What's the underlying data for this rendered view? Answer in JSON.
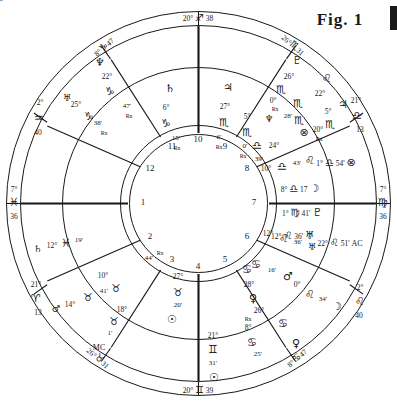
{
  "figure": {
    "caption": "Fig. 1",
    "type": "astrological-natal-chart-wheel"
  },
  "angles": {
    "mc": {
      "label_deg": "20°",
      "sign_glyph": "♐",
      "label_min": "38",
      "name": "MC",
      "text": "20° ♐ 38"
    },
    "ic": {
      "label_deg": "20°",
      "sign_glyph": "♊",
      "label_min": "39",
      "name": "IC",
      "text": "20° ♊ 39"
    },
    "dsc": {
      "label_deg": "7°",
      "sign_glyph": "♓",
      "label_min": "36",
      "name": "DSC",
      "text": "7° ♓ 36"
    },
    "asc": {
      "label_deg": "7°",
      "sign_glyph": "♍",
      "label_min": "36",
      "name": "ASC",
      "text": "7° ♍ 36"
    }
  },
  "outer_cusps": [
    {
      "id": "cusp-11",
      "deg": "8°",
      "glyph": "♑",
      "min": "47"
    },
    {
      "id": "cusp-12",
      "deg": "2°",
      "glyph": "♒",
      "min": "40"
    },
    {
      "id": "cusp-1",
      "deg": "21°",
      "glyph": "♈",
      "min": "13"
    },
    {
      "id": "cusp-2",
      "deg": "26°",
      "glyph": "♉",
      "min": "31"
    },
    {
      "id": "cusp-3",
      "deg": "8°",
      "glyph": "♋",
      "min": "47"
    },
    {
      "id": "cusp-4",
      "deg": "2°",
      "glyph": "♌",
      "min": "40"
    },
    {
      "id": "cusp-5",
      "deg": "21°",
      "glyph": "♎",
      "min": "13"
    },
    {
      "id": "cusp-6",
      "deg": "26°",
      "glyph": "♏",
      "min": "31"
    }
  ],
  "outer_planets": [
    {
      "id": "outer-neptune",
      "planet": "♆",
      "deg": "22°",
      "sign": "♑",
      "min": "",
      "rx": ""
    },
    {
      "id": "outer-uranus",
      "planet": "♅",
      "deg": "25°",
      "sign": "♑",
      "min": "38'",
      "rx": "Rx"
    },
    {
      "id": "outer-saturnish",
      "planet": "",
      "deg": "",
      "sign": "",
      "min": "47'",
      "rx": "Rx"
    },
    {
      "id": "outer-pluto",
      "planet": "♇",
      "deg": "26°",
      "sign": "♏",
      "min": "",
      "rx": ""
    },
    {
      "id": "outer-neptune2",
      "planet": "♆",
      "deg": "0°",
      "sign": "♏",
      "min": "28'",
      "rx": "Rx"
    },
    {
      "id": "outer-leo22",
      "planet": "",
      "deg": "22°",
      "sign": "♌",
      "min": "",
      "rx": ""
    },
    {
      "id": "outer-jupiter",
      "planet": "♃",
      "deg": "5°",
      "sign": "♏",
      "min": "",
      "rx": ""
    },
    {
      "id": "outer-fortune",
      "planet": "⊗",
      "deg": "20°",
      "sign": "♏",
      "min": "",
      "rx": "Rx"
    },
    {
      "id": "outer-libra24",
      "planet": "",
      "deg": "24°",
      "sign": "♎",
      "min": "39'",
      "rx": ""
    },
    {
      "id": "outer-leo43",
      "planet": "♌",
      "deg": "10°",
      "sign": "♎",
      "min": "43'",
      "rx": ""
    },
    {
      "id": "outer-uranus2",
      "planet": "♅",
      "deg": "12°",
      "sign": "♌",
      "min": "36'",
      "rx": ""
    },
    {
      "id": "outer-leo0",
      "planet": "",
      "deg": "0°",
      "sign": "♌",
      "min": "34'",
      "rx": ""
    },
    {
      "id": "outer-moon2",
      "planet": "☽",
      "deg": "",
      "sign": "",
      "min": "",
      "rx": ""
    },
    {
      "id": "outer-cancer16",
      "planet": "",
      "deg": "",
      "sign": "♋",
      "min": "16'",
      "rx": ""
    },
    {
      "id": "outer-mars2",
      "planet": "♂",
      "deg": "",
      "sign": "",
      "min": "",
      "rx": ""
    },
    {
      "id": "outer-cancer28",
      "planet": "",
      "deg": "28°",
      "sign": "♋",
      "min": "",
      "rx": ""
    },
    {
      "id": "outer-venus2",
      "planet": "♀",
      "deg": "26°",
      "sign": "",
      "min": "",
      "rx": ""
    },
    {
      "id": "outer-cancer8",
      "planet": "",
      "deg": "8°",
      "sign": "♋",
      "min": "",
      "rx": "Rx"
    },
    {
      "id": "outer-cancer25",
      "planet": "",
      "deg": "",
      "sign": "♋",
      "min": "25'",
      "rx": ""
    },
    {
      "id": "outer-cancer58",
      "planet": "",
      "deg": "",
      "sign": "♋",
      "min": "58'",
      "rx": ""
    },
    {
      "id": "outer-venus3",
      "planet": "♀",
      "deg": "",
      "sign": "",
      "min": "",
      "rx": ""
    },
    {
      "id": "outer-taurus41",
      "planet": "",
      "deg": "",
      "sign": "♉",
      "min": "41'",
      "rx": ""
    },
    {
      "id": "outer-mars3",
      "planet": "♂",
      "deg": "14°",
      "sign": "",
      "min": "",
      "rx": ""
    },
    {
      "id": "outer-taurus10",
      "planet": "",
      "deg": "10°",
      "sign": "♉",
      "min": "",
      "rx": ""
    },
    {
      "id": "outer-taurus18",
      "planet": "",
      "deg": "18°",
      "sign": "♉",
      "min": "1'",
      "rx": ""
    },
    {
      "id": "outer-mc-label",
      "planet": "",
      "deg": "",
      "sign": "",
      "min": "MC",
      "rx": ""
    },
    {
      "id": "outer-saturn",
      "planet": "♄",
      "deg": "12°",
      "sign": "♓",
      "min": "19'",
      "rx": ""
    },
    {
      "id": "outer-taurus44",
      "planet": "",
      "deg": "",
      "sign": "",
      "min": "44'",
      "rx": "Rx"
    }
  ],
  "mid_ring": [
    {
      "id": "mid-saturn",
      "planet": "♄",
      "deg": "6°",
      "sign": "♑",
      "min": "15'",
      "rx": "Rx"
    },
    {
      "id": "mid-jupiter",
      "planet": "♃",
      "deg": "27°",
      "sign": "♏",
      "min": "6'",
      "rx": "Rx"
    },
    {
      "id": "mid-neptune",
      "planet": "♆",
      "deg": "5°",
      "sign": "♏",
      "min": "0'",
      "rx": "Rx"
    },
    {
      "id": "mid-sun",
      "planet": "☉",
      "deg": "27°",
      "sign": "♉",
      "min": "20'",
      "rx": ""
    },
    {
      "id": "mid-sun2",
      "planet": "☉",
      "deg": "21°",
      "sign": "♊",
      "min": "31'",
      "rx": ""
    }
  ],
  "inner_rows": [
    {
      "id": "row-fortune",
      "deg": "1°",
      "glyph": "♎",
      "min": "54'",
      "planet": "⊗"
    },
    {
      "id": "row-moon",
      "deg": "8°",
      "glyph": "♎",
      "min": "17",
      "planet": "☽"
    },
    {
      "id": "row-pluto",
      "deg": "1°",
      "glyph": "♍",
      "min": "41'",
      "planet": "♇"
    },
    {
      "id": "row-uranus",
      "deg": "12°",
      "glyph": "♌",
      "min": "36'",
      "planet": "♅"
    },
    {
      "id": "row-asc",
      "deg": "22°",
      "glyph": "♌",
      "min": "51'",
      "planet": "AC"
    }
  ],
  "house_numbers": [
    "1",
    "2",
    "3",
    "4",
    "5",
    "6",
    "7",
    "8",
    "9",
    "10",
    "11",
    "12"
  ],
  "colors": {
    "ink": "#17171a",
    "paper": "#ffffff"
  }
}
